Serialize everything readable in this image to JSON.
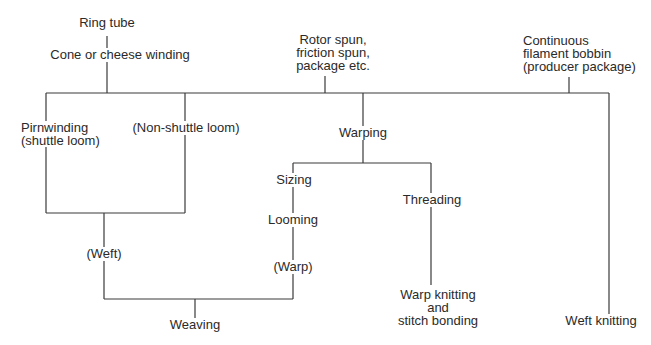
{
  "diagram": {
    "nodes": {
      "ring_tube": "Ring tube",
      "cone_winding": "Cone or cheese winding",
      "rotor_spun": [
        "Rotor spun,",
        "friction spun,",
        "package etc."
      ],
      "continuous_filament": [
        "Continuous",
        "filament bobbin",
        "(producer package)"
      ],
      "pirnwinding": [
        "Pirnwinding",
        "(shuttle loom)"
      ],
      "non_shuttle": "(Non-shuttle loom)",
      "warping": "Warping",
      "sizing": "Sizing",
      "looming": "Looming",
      "warp": "(Warp)",
      "threading": "Threading",
      "weft": "(Weft)",
      "weaving": "Weaving",
      "warp_knitting": [
        "Warp knitting",
        "and",
        "stitch bonding"
      ],
      "weft_knitting": "Weft knitting"
    }
  }
}
